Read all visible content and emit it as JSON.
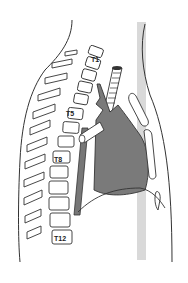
{
  "diagram": {
    "vertebra_labels": [
      "T1",
      "T5",
      "T8",
      "T12"
    ],
    "colors": {
      "background": "#ffffff",
      "line": "#333333",
      "heart_fill": "#7a7a7a",
      "reference_band": "#d9d9d9"
    }
  }
}
